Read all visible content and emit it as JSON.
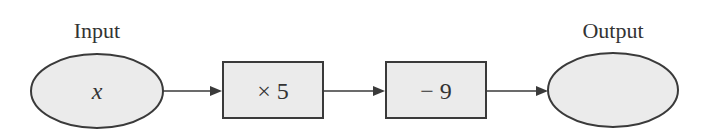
{
  "diagram": {
    "type": "function-machine",
    "input": {
      "label": "Input",
      "value": "x"
    },
    "steps": [
      {
        "operation": "× 5"
      },
      {
        "operation": "− 9"
      }
    ],
    "output": {
      "label": "Output",
      "value": ""
    }
  }
}
